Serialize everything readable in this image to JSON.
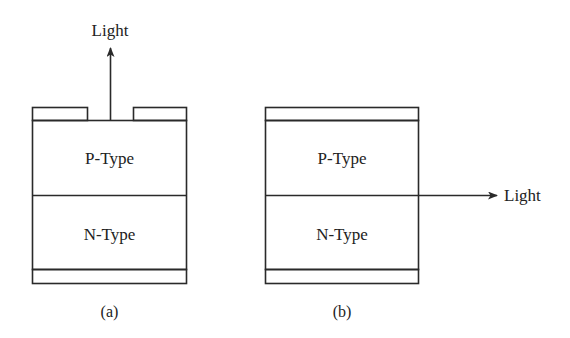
{
  "diagrams": [
    {
      "id": "a",
      "caption": "(a)",
      "layers": [
        {
          "label": "P-Type"
        },
        {
          "label": "N-Type"
        }
      ],
      "light": {
        "label": "Light",
        "direction": "up",
        "description": "Surface-emitting LED: light exits through gap in top contact"
      },
      "top_contact": "split",
      "bottom_contact": "full"
    },
    {
      "id": "b",
      "caption": "(b)",
      "layers": [
        {
          "label": "P-Type"
        },
        {
          "label": "N-Type"
        }
      ],
      "light": {
        "label": "Light",
        "direction": "right",
        "description": "Edge-emitting LED: light exits from junction edge"
      },
      "top_contact": "full",
      "bottom_contact": "full"
    }
  ],
  "colors": {
    "stroke": "#2a2a2a",
    "text": "#222222",
    "background": "#ffffff"
  }
}
